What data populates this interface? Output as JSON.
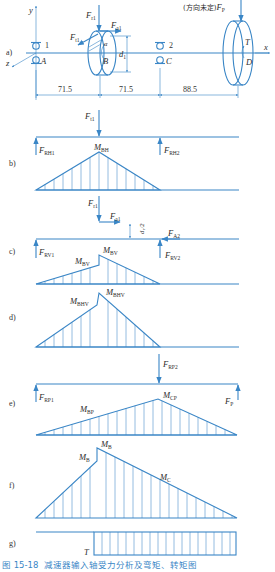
{
  "figure": {
    "caption_number": "图 15-18",
    "caption_text": "减速器输入轴受力分析及弯矩、转矩图",
    "line_color": "#3a86c6",
    "text_color": "#2b2b2b"
  },
  "panel_a": {
    "label": "a)",
    "axes": {
      "x": "x",
      "y": "y",
      "z": "z"
    },
    "bearing_1": "1",
    "bearing_2": "2",
    "point_A": "A",
    "point_B": "B",
    "point_C": "C",
    "point_D": "D",
    "torque": "T",
    "gear_angle": "α",
    "diameter": "d",
    "diameter_sub": "1",
    "force_Ft1": {
      "main": "F",
      "sub": "t1"
    },
    "force_Fr1": {
      "main": "F",
      "sub": "r1"
    },
    "force_Fa1": {
      "main": "F",
      "sub": "a1"
    },
    "force_Fp_note": "(方向未定)",
    "force_Fp": {
      "main": "F",
      "sub": "P"
    },
    "dimensions": [
      "71.5",
      "71.5",
      "88.5"
    ]
  },
  "panel_b": {
    "label": "b)",
    "force_Ft1": {
      "main": "F",
      "sub": "t1"
    },
    "force_FRH1": {
      "main": "F",
      "sub": "RH1"
    },
    "force_FRH2": {
      "main": "F",
      "sub": "RH2"
    },
    "moment": {
      "main": "M",
      "sub": "BH"
    }
  },
  "panel_c": {
    "label": "c)",
    "force_Fr1": {
      "main": "F",
      "sub": "r1"
    },
    "force_Fa1": {
      "main": "F",
      "sub": "a1"
    },
    "offset": "d₁/2",
    "force_FA2": {
      "main": "F",
      "sub": "A2"
    },
    "force_FRV1": {
      "main": "F",
      "sub": "RV1"
    },
    "force_FRV2": {
      "main": "F",
      "sub": "RV2"
    },
    "moment_left": {
      "main": "M",
      "sub": "BV",
      "sup": "-"
    },
    "moment_right": {
      "main": "M",
      "sub": "BV",
      "sup": "+"
    }
  },
  "panel_d": {
    "label": "d)",
    "moment_left": {
      "main": "M",
      "sub": "BHV",
      "sup": "-"
    },
    "moment_right": {
      "main": "M",
      "sub": "BHV",
      "sup": "+"
    }
  },
  "panel_e": {
    "label": "e)",
    "force_FRP2": {
      "main": "F",
      "sub": "RP2"
    },
    "force_FRP1": {
      "main": "F",
      "sub": "RP1"
    },
    "force_FP": {
      "main": "F",
      "sub": "P"
    },
    "moment_B": {
      "main": "M",
      "sub": "BP"
    },
    "moment_C": {
      "main": "M",
      "sub": "CP"
    }
  },
  "panel_f": {
    "label": "f)",
    "moment_left": {
      "main": "M",
      "sub": "B",
      "sup": "-"
    },
    "moment_right": {
      "main": "M",
      "sub": "B",
      "sup": "+"
    },
    "moment_C": {
      "main": "M",
      "sub": "C"
    }
  },
  "panel_g": {
    "label": "g)",
    "torque": "T"
  }
}
